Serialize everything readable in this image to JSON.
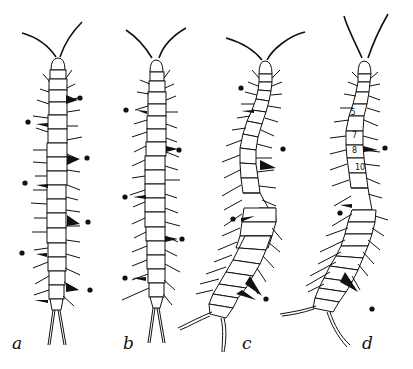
{
  "figure": {
    "ink_color": "#111111",
    "background": "#ffffff",
    "panels": [
      {
        "id": "a",
        "label": "a",
        "shape": "straight",
        "markers": 8
      },
      {
        "id": "b",
        "label": "b",
        "shape": "straight",
        "markers": 6
      },
      {
        "id": "c",
        "label": "c",
        "shape": "curved",
        "markers": 4
      },
      {
        "id": "d",
        "label": "d",
        "shape": "curved",
        "markers": 3,
        "segment_numbers": [
          "5",
          "7",
          "8",
          "10"
        ]
      }
    ]
  }
}
